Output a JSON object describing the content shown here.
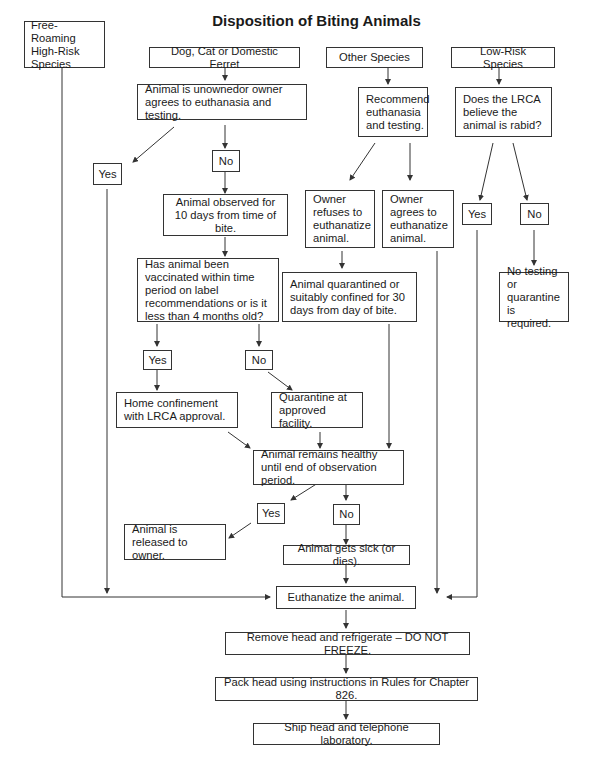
{
  "title": "Disposition of Biting Animals",
  "nodes": {
    "free_roaming": "Free-Roaming High-Risk Species",
    "dog_cat": "Dog, Cat or Domestic Ferret",
    "other_species": "Other Species",
    "low_risk": "Low-Risk Species",
    "unowned": "Animal is unownedor owner agrees to euthanasia and testing.",
    "recommend": "Recommend euthanasia and testing.",
    "lrca_rabid": "Does the LRCA believe the animal is rabid?",
    "yes_1": "Yes",
    "no_1": "No",
    "observed": "Animal observed for 10 days from time of bite.",
    "owner_refuses": "Owner refuses to euthanatize animal.",
    "owner_agrees": "Owner agrees to euthanatize animal.",
    "yes_lr": "Yes",
    "no_lr": "No",
    "vaccinated": "Has animal been vaccinated within time period on label recommendations or is it less than 4 months old?",
    "quarantined_30": "Animal quarantined or suitably confined for 30 days from day of bite.",
    "no_testing": "No testing or quarantine is required.",
    "yes_2": "Yes",
    "no_2": "No",
    "home_confinement": "Home confinement with LRCA approval.",
    "quarantine_facility": "Quarantine at approved facility.",
    "remains_healthy": "Animal remains healthy until end of observation period.",
    "yes_3": "Yes",
    "no_3": "No",
    "released": "Animal is released to owner.",
    "gets_sick": "Animal gets sick (or dies).",
    "euthanatize": "Euthanatize the animal.",
    "remove_head": "Remove head and refrigerate – DO NOT FREEZE.",
    "pack_head": "Pack head using instructions in Rules for Chapter 826.",
    "ship_head": "Ship head and telephone laboratory."
  },
  "colors": {
    "line": "#333333",
    "text": "#1a1a1a",
    "background": "#ffffff"
  }
}
